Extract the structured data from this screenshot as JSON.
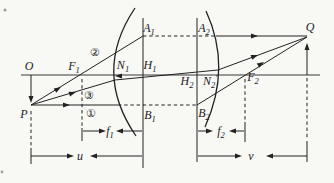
{
  "figure": {
    "width": 334,
    "height": 183,
    "background_color": "#f8f8f5",
    "ink_color": "#222222",
    "labels": [
      {
        "name": "label-O",
        "text": "O",
        "sub": "",
        "prime": false,
        "style": "math",
        "x": 29,
        "y": 66
      },
      {
        "name": "label-F1",
        "text": "F",
        "sub": "1",
        "prime": false,
        "style": "math",
        "x": 74,
        "y": 66
      },
      {
        "name": "label-N1",
        "text": "N",
        "sub": "1",
        "prime": false,
        "style": "math",
        "x": 123,
        "y": 65
      },
      {
        "name": "label-H1",
        "text": "H",
        "sub": "1",
        "prime": false,
        "style": "math",
        "x": 150,
        "y": 65
      },
      {
        "name": "label-A1",
        "text": "A",
        "sub": "1",
        "prime": false,
        "style": "math",
        "x": 149,
        "y": 28
      },
      {
        "name": "label-A2",
        "text": "A",
        "sub": "2",
        "prime": false,
        "style": "math",
        "x": 204,
        "y": 28
      },
      {
        "name": "label-H2",
        "text": "H",
        "sub": "2",
        "prime": false,
        "style": "math",
        "x": 187,
        "y": 81
      },
      {
        "name": "label-N2-prime",
        "text": "N",
        "sub": "2",
        "prime": true,
        "style": "math",
        "x": 210,
        "y": 81
      },
      {
        "name": "label-F2",
        "text": "F",
        "sub": "2",
        "prime": false,
        "style": "math",
        "x": 253,
        "y": 77
      },
      {
        "name": "label-Q",
        "text": "Q",
        "sub": "",
        "prime": false,
        "style": "math",
        "x": 310,
        "y": 27
      },
      {
        "name": "label-P",
        "text": "P",
        "sub": "",
        "prime": false,
        "style": "math",
        "x": 24,
        "y": 114
      },
      {
        "name": "label-B1",
        "text": "B",
        "sub": "1",
        "prime": false,
        "style": "math",
        "x": 150,
        "y": 115
      },
      {
        "name": "label-B2",
        "text": "B",
        "sub": "2",
        "prime": false,
        "style": "math",
        "x": 204,
        "y": 113
      },
      {
        "name": "label-ray1",
        "text": "①",
        "sub": "",
        "prime": false,
        "style": "circled",
        "x": 91,
        "y": 113
      },
      {
        "name": "label-ray2",
        "text": "②",
        "sub": "",
        "prime": false,
        "style": "circled",
        "x": 95,
        "y": 52
      },
      {
        "name": "label-ray3",
        "text": "③",
        "sub": "",
        "prime": false,
        "style": "circled",
        "x": 89,
        "y": 95
      },
      {
        "name": "label-f1",
        "text": "f",
        "sub": "1",
        "prime": false,
        "style": "math",
        "x": 110,
        "y": 131
      },
      {
        "name": "label-f2",
        "text": "f",
        "sub": "2",
        "prime": false,
        "style": "math",
        "x": 221,
        "y": 131
      },
      {
        "name": "label-u",
        "text": "u",
        "sub": "",
        "prime": false,
        "style": "math",
        "x": 80,
        "y": 156
      },
      {
        "name": "label-v",
        "text": "v",
        "sub": "",
        "prime": false,
        "style": "math",
        "x": 251,
        "y": 156
      }
    ],
    "solid_lines": [
      {
        "name": "optical-axis",
        "x1": 21,
        "y1": 75,
        "x2": 320,
        "y2": 75,
        "w": 0.9
      },
      {
        "name": "h1-principal-plane",
        "x1": 143,
        "y1": 18,
        "x2": 143,
        "y2": 168,
        "w": 1
      },
      {
        "name": "h2-principal-plane",
        "x1": 197,
        "y1": 18,
        "x2": 197,
        "y2": 162,
        "w": 1
      },
      {
        "name": "object-arrow-shaft",
        "x1": 31,
        "y1": 75,
        "x2": 31,
        "y2": 100,
        "w": 1
      },
      {
        "name": "image-arrow-shaft",
        "x1": 307,
        "y1": 75,
        "x2": 307,
        "y2": 45,
        "w": 1
      },
      {
        "name": "ray1-incident",
        "x1": 31,
        "y1": 105,
        "x2": 118,
        "y2": 105,
        "w": 1
      },
      {
        "name": "ray1-emergent",
        "x1": 197,
        "y1": 105,
        "x2": 307,
        "y2": 37,
        "w": 1
      },
      {
        "name": "ray2-incident",
        "x1": 31,
        "y1": 105,
        "x2": 143,
        "y2": 36,
        "w": 1
      },
      {
        "name": "ray2-emergent",
        "x1": 216,
        "y1": 36,
        "x2": 307,
        "y2": 36,
        "w": 1
      },
      {
        "name": "ray3-incident",
        "x1": 31,
        "y1": 105,
        "x2": 115,
        "y2": 80,
        "w": 1
      },
      {
        "name": "ray3-internal",
        "x1": 115,
        "y1": 80,
        "x2": 218,
        "y2": 70,
        "w": 1
      },
      {
        "name": "ray3-emergent",
        "x1": 218,
        "y1": 70,
        "x2": 307,
        "y2": 37,
        "w": 1
      },
      {
        "name": "f1-left-terminus-bar",
        "x1": 82,
        "y1": 128,
        "x2": 82,
        "y2": 141,
        "w": 1
      },
      {
        "name": "f2-right-terminus-bar",
        "x1": 245,
        "y1": 122,
        "x2": 245,
        "y2": 142,
        "w": 1
      },
      {
        "name": "u-left-terminus-bar",
        "x1": 31,
        "y1": 148,
        "x2": 31,
        "y2": 164,
        "w": 1
      },
      {
        "name": "v-right-terminus-bar",
        "x1": 307,
        "y1": 141,
        "x2": 307,
        "y2": 162,
        "w": 1
      },
      {
        "name": "f1-dim-left-shaft",
        "x1": 83,
        "y1": 131,
        "x2": 100,
        "y2": 131,
        "w": 1
      },
      {
        "name": "f1-dim-right-shaft",
        "x1": 122,
        "y1": 131,
        "x2": 142,
        "y2": 131,
        "w": 1
      },
      {
        "name": "f2-dim-left-shaft",
        "x1": 198,
        "y1": 131,
        "x2": 207,
        "y2": 131,
        "w": 1
      },
      {
        "name": "f2-dim-right-shaft",
        "x1": 235,
        "y1": 131,
        "x2": 244,
        "y2": 131,
        "w": 1
      },
      {
        "name": "u-dim-left-shaft",
        "x1": 31,
        "y1": 156,
        "x2": 68,
        "y2": 156,
        "w": 1
      },
      {
        "name": "u-dim-right-shaft",
        "x1": 96,
        "y1": 156,
        "x2": 142,
        "y2": 156,
        "w": 1
      },
      {
        "name": "v-dim-left-shaft",
        "x1": 198,
        "y1": 156,
        "x2": 236,
        "y2": 156,
        "w": 1
      },
      {
        "name": "v-dim-right-shaft",
        "x1": 272,
        "y1": 156,
        "x2": 307,
        "y2": 156,
        "w": 1
      }
    ],
    "dashed_lines": [
      {
        "name": "a1-a2-transfer",
        "x1": 143,
        "y1": 36,
        "x2": 216,
        "y2": 36
      },
      {
        "name": "b1-b2-transfer",
        "x1": 118,
        "y1": 105,
        "x2": 197,
        "y2": 105
      },
      {
        "name": "f1-vertical",
        "x1": 82,
        "y1": 79,
        "x2": 82,
        "y2": 127
      },
      {
        "name": "f2-vertical",
        "x1": 245,
        "y1": 79,
        "x2": 245,
        "y2": 121
      },
      {
        "name": "p-vertical",
        "x1": 31,
        "y1": 111,
        "x2": 31,
        "y2": 147
      },
      {
        "name": "q-vertical",
        "x1": 307,
        "y1": 78,
        "x2": 307,
        "y2": 140
      }
    ],
    "lens_surfaces": [
      {
        "name": "left-lens-surface",
        "d": "M 135,8 Q 92,72 136,136"
      },
      {
        "name": "right-lens-surface",
        "d": "M 206,11 Q 232,67 205,127"
      }
    ],
    "arrowheads": [
      {
        "name": "ray1-incident-arrowhead",
        "x": 70,
        "y": 105,
        "angle": 0
      },
      {
        "name": "ray2-incident-arrowhead",
        "x": 61,
        "y": 87,
        "angle": -31
      },
      {
        "name": "ray3-incident-arrowhead",
        "x": 76,
        "y": 92,
        "angle": -17
      },
      {
        "name": "object-arrowhead",
        "x": 31,
        "y": 103,
        "angle": 90
      },
      {
        "name": "ray2-emergent-arrowhead",
        "x": 258,
        "y": 36,
        "angle": 0
      },
      {
        "name": "ray3-emergent-arrowhead",
        "x": 258,
        "y": 55,
        "angle": -20
      },
      {
        "name": "ray1-emergent-arrowhead",
        "x": 264,
        "y": 62,
        "angle": -32
      },
      {
        "name": "image-arrowhead",
        "x": 307,
        "y": 43,
        "angle": -90
      },
      {
        "name": "nodal-point-arrowhead",
        "x": 115,
        "y": 76,
        "angle": 180
      },
      {
        "name": "f1-dim-right-arrowhead",
        "x": 106,
        "y": 131,
        "angle": 0
      },
      {
        "name": "f1-dim-left-arrowhead",
        "x": 116,
        "y": 131,
        "angle": 180
      },
      {
        "name": "f2-dim-right-arrowhead",
        "x": 213,
        "y": 131,
        "angle": 0
      },
      {
        "name": "f2-dim-left-arrowhead",
        "x": 229,
        "y": 131,
        "angle": 180
      },
      {
        "name": "u-dim-right-arrowhead",
        "x": 74,
        "y": 156,
        "angle": 0
      },
      {
        "name": "u-dim-left-arrowhead",
        "x": 90,
        "y": 156,
        "angle": 180
      },
      {
        "name": "v-dim-right-arrowhead",
        "x": 242,
        "y": 156,
        "angle": 0
      },
      {
        "name": "v-dim-left-arrowhead",
        "x": 266,
        "y": 156,
        "angle": 180
      }
    ],
    "scan_specks": [
      {
        "name": "scan-speck-top-left",
        "x": 5,
        "y": 10,
        "r": 1.6
      },
      {
        "name": "scan-speck-bottom-left",
        "x": 2,
        "y": 172,
        "r": 1.4
      }
    ]
  }
}
